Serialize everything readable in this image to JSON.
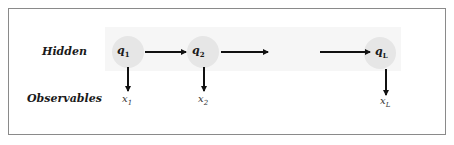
{
  "diagram": {
    "type": "hidden-markov-model",
    "row_labels": {
      "hidden": "Hidden",
      "observables": "Observables"
    },
    "hidden_nodes": [
      {
        "base": "q",
        "sub": "1"
      },
      {
        "base": "q",
        "sub": "2"
      },
      {
        "base": "q",
        "sub": "L"
      }
    ],
    "observable_nodes": [
      {
        "base": "x",
        "sub": "1"
      },
      {
        "base": "x",
        "sub": "2"
      },
      {
        "base": "x",
        "sub": "L"
      }
    ],
    "edges": [
      {
        "from": "q1",
        "to": "q2",
        "kind": "transition"
      },
      {
        "from": "q2",
        "to": "...",
        "kind": "transition"
      },
      {
        "from": "...",
        "to": "qL",
        "kind": "transition"
      },
      {
        "from": "q1",
        "to": "x1",
        "kind": "emission"
      },
      {
        "from": "q2",
        "to": "x2",
        "kind": "emission"
      },
      {
        "from": "qL",
        "to": "xL",
        "kind": "emission"
      }
    ],
    "colors": {
      "node_fill": "#e6e6e6",
      "arrow": "#111111",
      "border": "#8a8a8a",
      "band": "#f6f6f6"
    }
  }
}
